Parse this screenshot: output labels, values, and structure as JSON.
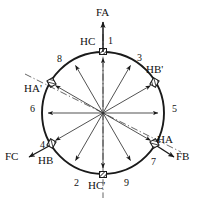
{
  "figure": {
    "type": "vector-circle-diagram",
    "width": 200,
    "height": 208,
    "center": {
      "x": 103,
      "y": 113
    },
    "radius": 61,
    "stroke_color": "#1a1a1a",
    "background": "#ffffff"
  },
  "axes": {
    "dashdot_vertical": {
      "label": "FA-axis",
      "angle_deg": 90
    },
    "dashdot_diagonal": {
      "label": "HA'-HB'-axis",
      "angle_deg": 30
    }
  },
  "slot_numbers": [
    {
      "id": "1",
      "label": "1",
      "angle_deg": 90,
      "lx": 108,
      "ly": 37
    },
    {
      "id": "3",
      "label": "3",
      "angle_deg": 60,
      "lx": 137,
      "ly": 54
    },
    {
      "id": "5",
      "label": "5",
      "angle_deg": 0,
      "lx": 172,
      "ly": 106
    },
    {
      "id": "7",
      "label": "7",
      "angle_deg": -30,
      "lx": 152,
      "ly": 160
    },
    {
      "id": "9",
      "label": "9",
      "angle_deg": -60,
      "lx": 124,
      "ly": 180
    },
    {
      "id": "2",
      "label": "2",
      "angle_deg": -120,
      "lx": 76,
      "ly": 180
    },
    {
      "id": "4",
      "label": "4",
      "angle_deg": -150,
      "lx": 41,
      "ly": 145
    },
    {
      "id": "6",
      "label": "6",
      "angle_deg": 180,
      "lx": 31,
      "ly": 106
    },
    {
      "id": "8",
      "label": "8",
      "angle_deg": 120,
      "lx": 58,
      "ly": 56
    }
  ],
  "winding_labels": [
    {
      "id": "HC",
      "label": "HC",
      "lx": 82,
      "ly": 37,
      "angle_deg": 90
    },
    {
      "id": "HBp",
      "label": "HB'",
      "lx": 146,
      "ly": 66,
      "angle_deg": 30
    },
    {
      "id": "HAp",
      "label": "HA'",
      "lx": 26,
      "ly": 85,
      "angle_deg": 150
    },
    {
      "id": "HA",
      "label": "HA",
      "lx": 158,
      "ly": 137,
      "angle_deg": -30
    },
    {
      "id": "HB",
      "label": "HB",
      "lx": 39,
      "ly": 158,
      "angle_deg": -150
    },
    {
      "id": "HCp",
      "label": "HC'",
      "lx": 90,
      "ly": 182,
      "angle_deg": -90
    }
  ],
  "external_vectors": [
    {
      "id": "FA",
      "label": "FA",
      "lx": 98,
      "ly": 8,
      "direction": "up"
    },
    {
      "id": "FB",
      "label": "FB",
      "lx": 176,
      "ly": 155,
      "direction": "down-right"
    },
    {
      "id": "FC",
      "label": "FC",
      "lx": 6,
      "ly": 155,
      "direction": "down-left"
    }
  ],
  "radial_vectors": [
    {
      "angle_deg": 90
    },
    {
      "angle_deg": 60
    },
    {
      "angle_deg": 30
    },
    {
      "angle_deg": 0
    },
    {
      "angle_deg": -30
    },
    {
      "angle_deg": -60
    },
    {
      "angle_deg": -90
    },
    {
      "angle_deg": -120
    },
    {
      "angle_deg": 180
    },
    {
      "angle_deg": 150
    },
    {
      "angle_deg": 120
    }
  ],
  "markers": {
    "square_positions": [
      90,
      -90
    ],
    "hatch_positions": [
      150,
      30,
      -30,
      -150
    ]
  }
}
